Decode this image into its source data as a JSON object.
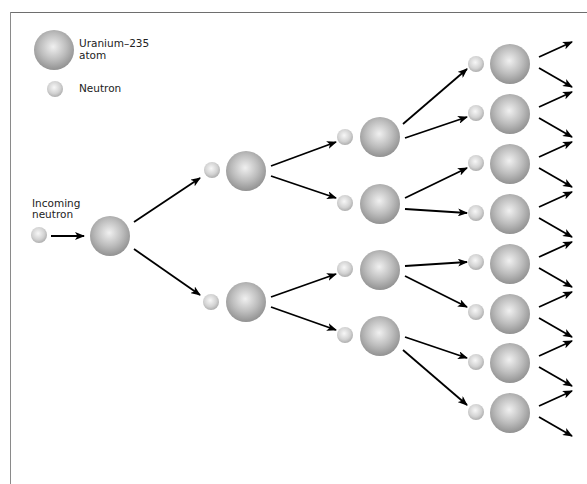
{
  "legend": {
    "atom_label_line1": "Uranium–235",
    "atom_label_line2": "atom",
    "neutron_label": "Neutron",
    "atom": {
      "x": 54,
      "y": 50,
      "r": 20
    },
    "neutron": {
      "x": 55,
      "y": 89,
      "r": 8
    }
  },
  "incoming": {
    "label_line1": "Incoming",
    "label_line2": "neutron",
    "neutron": {
      "x": 39,
      "y": 235,
      "r": 8
    },
    "arrow": [
      51,
      236,
      84,
      236
    ]
  },
  "colors": {
    "atom_light": "#ececec",
    "atom_mid": "#b9b9b9",
    "atom_dark": "#8f8f8f",
    "neutron_light": "#f4f4f4",
    "neutron_dark": "#b0b0b0",
    "arrow": "#000000",
    "frame": "#6e6e6e"
  },
  "chain": {
    "atoms": [
      {
        "gen": 0,
        "x": 110,
        "y": 236,
        "r": 20
      },
      {
        "gen": 1,
        "x": 246,
        "y": 171,
        "r": 20
      },
      {
        "gen": 1,
        "x": 246,
        "y": 302,
        "r": 20
      },
      {
        "gen": 2,
        "x": 380,
        "y": 137,
        "r": 20
      },
      {
        "gen": 2,
        "x": 380,
        "y": 204,
        "r": 20
      },
      {
        "gen": 2,
        "x": 380,
        "y": 270,
        "r": 20
      },
      {
        "gen": 2,
        "x": 380,
        "y": 336,
        "r": 20
      },
      {
        "gen": 3,
        "x": 510,
        "y": 64,
        "r": 20
      },
      {
        "gen": 3,
        "x": 510,
        "y": 114,
        "r": 20
      },
      {
        "gen": 3,
        "x": 510,
        "y": 164,
        "r": 20
      },
      {
        "gen": 3,
        "x": 510,
        "y": 214,
        "r": 20
      },
      {
        "gen": 3,
        "x": 510,
        "y": 264,
        "r": 20
      },
      {
        "gen": 3,
        "x": 510,
        "y": 314,
        "r": 20
      },
      {
        "gen": 3,
        "x": 510,
        "y": 363,
        "r": 20
      },
      {
        "gen": 3,
        "x": 510,
        "y": 413,
        "r": 20
      }
    ],
    "neutrons": [
      {
        "x": 212,
        "y": 170,
        "r": 8
      },
      {
        "x": 211,
        "y": 302,
        "r": 8
      },
      {
        "x": 345,
        "y": 137,
        "r": 8
      },
      {
        "x": 345,
        "y": 203,
        "r": 8
      },
      {
        "x": 345,
        "y": 269,
        "r": 8
      },
      {
        "x": 345,
        "y": 335,
        "r": 8
      },
      {
        "x": 476,
        "y": 64,
        "r": 8
      },
      {
        "x": 476,
        "y": 113,
        "r": 8
      },
      {
        "x": 476,
        "y": 163,
        "r": 8
      },
      {
        "x": 476,
        "y": 213,
        "r": 8
      },
      {
        "x": 476,
        "y": 262,
        "r": 8
      },
      {
        "x": 476,
        "y": 312,
        "r": 8
      },
      {
        "x": 476,
        "y": 362,
        "r": 8
      },
      {
        "x": 476,
        "y": 412,
        "r": 8
      }
    ],
    "arrows": [
      [
        134,
        222,
        200,
        178
      ],
      [
        134,
        249,
        200,
        295
      ],
      [
        271,
        166,
        336,
        142
      ],
      [
        271,
        176,
        336,
        198
      ],
      [
        271,
        297,
        336,
        274
      ],
      [
        271,
        307,
        336,
        330
      ],
      [
        403,
        124,
        467,
        69
      ],
      [
        405,
        138,
        467,
        117
      ],
      [
        405,
        198,
        467,
        168
      ],
      [
        405,
        209,
        467,
        213
      ],
      [
        405,
        266,
        467,
        262
      ],
      [
        405,
        276,
        467,
        307
      ],
      [
        405,
        337,
        467,
        358
      ],
      [
        403,
        350,
        467,
        405
      ]
    ],
    "output_arrow_offsets": {
      "x_start": 29,
      "x_end": 572,
      "up_start_dy": -7,
      "up_end_dy": -22,
      "down_start_dy": 4,
      "down_end_dy": 23
    }
  }
}
